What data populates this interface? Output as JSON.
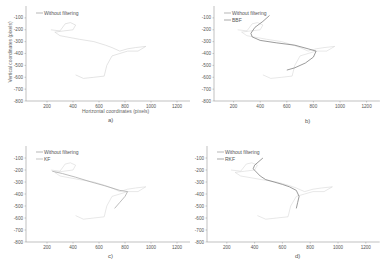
{
  "chart_data": [
    {
      "panel": "a)",
      "type": "line",
      "xlabel": "Horizontal coordinates (pixels)",
      "ylabel": "Vertical coordinates (pixels)",
      "xticks": [
        200,
        400,
        600,
        800,
        1000,
        1200
      ],
      "yticks": [
        -100,
        -200,
        -300,
        -400,
        -500,
        -600,
        -700,
        -800
      ],
      "xlim": [
        50,
        1300
      ],
      "ylim": [
        -800,
        0
      ],
      "grid": false,
      "legend_position": "upper left",
      "series": [
        {
          "name": "Without filtering",
          "color": "#c8c8c8",
          "x": [
            230,
            300,
            340,
            380,
            420,
            400,
            330,
            260,
            300,
            450,
            560,
            650,
            700,
            760,
            820,
            880,
            960,
            900,
            820,
            760,
            700,
            660,
            640,
            560,
            480,
            420
          ],
          "y": [
            -200,
            -210,
            -150,
            -140,
            -160,
            -200,
            -210,
            -220,
            -250,
            -280,
            -300,
            -330,
            -350,
            -380,
            -360,
            -350,
            -340,
            -380,
            -380,
            -400,
            -420,
            -500,
            -590,
            -600,
            -610,
            -580
          ]
        }
      ]
    },
    {
      "panel": "b)",
      "type": "line",
      "xticks": [
        200,
        400,
        600,
        800,
        1000,
        1200
      ],
      "yticks": [
        -100,
        -200,
        -300,
        -400,
        -500,
        -600,
        -700,
        -800
      ],
      "xlim": [
        50,
        1300
      ],
      "ylim": [
        -800,
        0
      ],
      "grid": false,
      "legend_position": "upper left",
      "series": [
        {
          "name": "Without filtering",
          "color": "#d0d0d0",
          "x": [
            230,
            300,
            340,
            380,
            420,
            400,
            330,
            260,
            300,
            450,
            560,
            650,
            700,
            760,
            820,
            880,
            960,
            900,
            820,
            760,
            700,
            660,
            640,
            560,
            480,
            420
          ],
          "y": [
            -200,
            -210,
            -150,
            -140,
            -160,
            -200,
            -210,
            -220,
            -250,
            -280,
            -300,
            -330,
            -350,
            -380,
            -360,
            -350,
            -340,
            -380,
            -380,
            -400,
            -420,
            -500,
            -590,
            -600,
            -610,
            -580
          ]
        },
        {
          "name": "BBF",
          "color": "#707070",
          "x": [
            470,
            420,
            360,
            330,
            340,
            400,
            520,
            660,
            760,
            820,
            800,
            740,
            660,
            600
          ],
          "y": [
            -80,
            -130,
            -180,
            -230,
            -260,
            -290,
            -310,
            -330,
            -360,
            -380,
            -430,
            -480,
            -520,
            -540
          ]
        }
      ]
    },
    {
      "panel": "c)",
      "type": "line",
      "xticks": [
        200,
        400,
        600,
        800,
        1000,
        1200
      ],
      "yticks": [
        -100,
        -200,
        -300,
        -400,
        -500,
        -600,
        -700,
        -800
      ],
      "xlim": [
        50,
        1300
      ],
      "ylim": [
        -800,
        0
      ],
      "grid": false,
      "legend_position": "upper left",
      "series": [
        {
          "name": "Without filtering",
          "color": "#d0d0d0",
          "x": [
            230,
            300,
            340,
            380,
            420,
            400,
            330,
            260,
            300,
            450,
            560,
            650,
            700,
            760,
            820,
            880,
            960,
            900,
            820,
            760,
            700,
            660,
            640,
            560,
            480,
            420
          ],
          "y": [
            -200,
            -210,
            -150,
            -140,
            -160,
            -200,
            -210,
            -220,
            -250,
            -280,
            -300,
            -330,
            -350,
            -380,
            -360,
            -350,
            -340,
            -380,
            -380,
            -400,
            -420,
            -500,
            -590,
            -600,
            -610,
            -580
          ]
        },
        {
          "name": "KF",
          "color": "#a0a0a0",
          "x": [
            240,
            320,
            420,
            540,
            640,
            700,
            760,
            820,
            800,
            760,
            720
          ],
          "y": [
            -210,
            -230,
            -260,
            -300,
            -330,
            -350,
            -370,
            -380,
            -420,
            -470,
            -520
          ]
        }
      ]
    },
    {
      "panel": "d)",
      "type": "line",
      "xticks": [
        200,
        400,
        600,
        800,
        1000,
        1200
      ],
      "yticks": [
        -100,
        -200,
        -300,
        -400,
        -500,
        -600,
        -700,
        -800
      ],
      "xlim": [
        50,
        1300
      ],
      "ylim": [
        -800,
        0
      ],
      "grid": false,
      "legend_position": "upper left",
      "series": [
        {
          "name": "Without filtering",
          "color": "#d0d0d0",
          "x": [
            230,
            300,
            340,
            380,
            420,
            400,
            330,
            260,
            300,
            450,
            560,
            650,
            700,
            760,
            820,
            880,
            960,
            900,
            820,
            760,
            700,
            660,
            640,
            560,
            480,
            420
          ],
          "y": [
            -200,
            -210,
            -150,
            -140,
            -160,
            -200,
            -210,
            -220,
            -250,
            -280,
            -300,
            -330,
            -350,
            -380,
            -360,
            -350,
            -340,
            -380,
            -380,
            -400,
            -420,
            -500,
            -590,
            -600,
            -610,
            -580
          ]
        },
        {
          "name": "RKF",
          "color": "#707070",
          "x": [
            460,
            400,
            390,
            440,
            480,
            540,
            600,
            650,
            700,
            720,
            710,
            700
          ],
          "y": [
            -100,
            -160,
            -190,
            -250,
            -280,
            -300,
            -320,
            -340,
            -370,
            -420,
            -470,
            -520
          ]
        }
      ]
    }
  ],
  "panels": {
    "a": {
      "caption": "a)",
      "legend": [
        "Without filtering"
      ],
      "xlabel": "Horizontal coordinates (pixels)",
      "ylabel": "Vertical coordinates (pixels)"
    },
    "b": {
      "caption": "b)",
      "legend": [
        "Without filtering",
        "BBF"
      ]
    },
    "c": {
      "caption": "c)",
      "legend": [
        "Without filtering",
        "KF"
      ]
    },
    "d": {
      "caption": "d)",
      "legend": [
        "Without filtering",
        "RKF"
      ]
    }
  },
  "axis": {
    "xticks": [
      "200",
      "400",
      "600",
      "800",
      "1000",
      "1200"
    ],
    "yticks": [
      "-100",
      "-200",
      "-300",
      "-400",
      "-500",
      "-600",
      "-700",
      "-800"
    ]
  }
}
